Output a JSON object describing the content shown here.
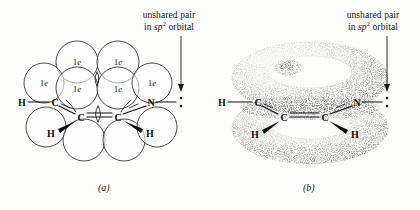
{
  "figure": {
    "background_color": "#fdfdfc",
    "ink_color": "#111111"
  },
  "annotations": {
    "left": {
      "line1": "unshared pair",
      "line2_prefix": "in ",
      "line2_orbital": "sp",
      "line2_superscript": "2",
      "line2_suffix": " orbital"
    },
    "right": {
      "line1": "unshared pair",
      "line2_prefix": "in ",
      "line2_orbital": "sp",
      "line2_superscript": "2",
      "line2_suffix": " orbital"
    }
  },
  "captions": {
    "panel_a": "(a)",
    "panel_b": "(b)"
  },
  "panel_a": {
    "type": "orbital-overlap-circles",
    "orbital_labels": [
      {
        "text_number": "1",
        "text_italic": "e",
        "x": 77,
        "y": 62
      },
      {
        "text_number": "1",
        "text_italic": "e",
        "x": 118,
        "y": 62
      },
      {
        "text_number": "1",
        "text_italic": "e",
        "x": 48,
        "y": 83
      },
      {
        "text_number": "1",
        "text_italic": "e",
        "x": 77,
        "y": 88
      },
      {
        "text_number": "1",
        "text_italic": "e",
        "x": 118,
        "y": 88
      },
      {
        "text_number": "1",
        "text_italic": "e",
        "x": 150,
        "y": 83
      }
    ],
    "atoms": [
      {
        "label": "H",
        "x": 22,
        "y": 102
      },
      {
        "label": "C",
        "x": 55,
        "y": 102
      },
      {
        "label": "C",
        "x": 80,
        "y": 117
      },
      {
        "label": "C",
        "x": 118,
        "y": 117
      },
      {
        "label": "N",
        "x": 150,
        "y": 102
      },
      {
        "label": "H",
        "x": 52,
        "y": 132
      },
      {
        "label": "H",
        "x": 150,
        "y": 132
      }
    ],
    "lone_pair_dots": 2
  },
  "panel_b": {
    "type": "pi-electron-cloud-torus",
    "torus_count": 2,
    "atoms": [
      {
        "label": "H",
        "x": 222,
        "y": 102
      },
      {
        "label": "C",
        "x": 258,
        "y": 102
      },
      {
        "label": "C",
        "x": 283,
        "y": 117
      },
      {
        "label": "C",
        "x": 325,
        "y": 117
      },
      {
        "label": "N",
        "x": 357,
        "y": 102
      },
      {
        "label": "H",
        "x": 255,
        "y": 132
      },
      {
        "label": "H",
        "x": 355,
        "y": 132
      }
    ],
    "lone_pair_dots": 2
  }
}
